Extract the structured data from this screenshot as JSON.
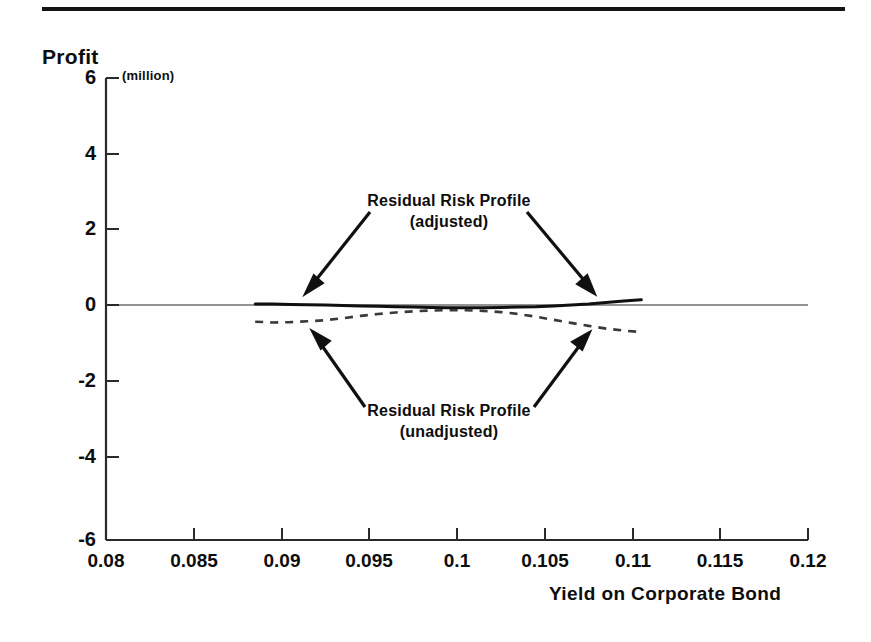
{
  "figure": {
    "has_header_rule": true,
    "background_color": "#fefefe",
    "ink_color": "#0d0d0d"
  },
  "axes": {
    "y_title": "Profit",
    "y_unit_note": "(million)",
    "x_title": "Yield on Corporate Bond"
  },
  "annotations": {
    "adjusted": {
      "line1": "Residual Risk Profile",
      "line2": "(adjusted)"
    },
    "unadjusted": {
      "line1": "Residual Risk Profile",
      "line2": "(unadjusted)"
    }
  },
  "chart_data": {
    "type": "line",
    "title": "",
    "subtitle": "",
    "xlabel": "Yield on Corporate Bond",
    "ylabel": "Profit",
    "y_unit": "(million)",
    "xlim": [
      0.08,
      0.12
    ],
    "ylim": [
      -6,
      6
    ],
    "xticks": [
      "0.08",
      "0.085",
      "0.09",
      "0.095",
      "0.1",
      "0.105",
      "0.11",
      "0.115",
      "0.12"
    ],
    "xtick_values": [
      0.08,
      0.085,
      0.09,
      0.095,
      0.1,
      0.105,
      0.11,
      0.115,
      0.12
    ],
    "yticks": [
      "6",
      "4",
      "2",
      "0",
      "-2",
      "-4",
      "-6"
    ],
    "ytick_values": [
      6,
      4,
      2,
      0,
      -2,
      -4,
      -6
    ],
    "grid": false,
    "legend": "annotations-with-arrows",
    "zero_line": true,
    "series": [
      {
        "name": "Residual Risk Profile (adjusted)",
        "style": "solid",
        "color": "#101010",
        "x": [
          0.0885,
          0.0895,
          0.0905,
          0.0915,
          0.0925,
          0.0935,
          0.0945,
          0.0955,
          0.0965,
          0.0975,
          0.0985,
          0.0995,
          0.1005,
          0.1015,
          0.1025,
          0.1035,
          0.1045,
          0.1055,
          0.1065,
          0.1075,
          0.1085,
          0.1095,
          0.1105
        ],
        "values": [
          0.13,
          0.13,
          0.12,
          0.11,
          0.1,
          0.09,
          0.08,
          0.07,
          0.06,
          0.05,
          0.04,
          0.03,
          0.03,
          0.03,
          0.04,
          0.05,
          0.06,
          0.08,
          0.1,
          0.13,
          0.17,
          0.21,
          0.24
        ]
      },
      {
        "name": "Residual Risk Profile (unadjusted)",
        "style": "dashed",
        "color": "#3a3a3a",
        "x": [
          0.0885,
          0.0895,
          0.0905,
          0.0915,
          0.0925,
          0.0935,
          0.0945,
          0.0955,
          0.0965,
          0.0975,
          0.0985,
          0.0995,
          0.1005,
          0.1015,
          0.1025,
          0.1035,
          0.1045,
          0.1055,
          0.1065,
          0.1075,
          0.1085,
          0.1095,
          0.1105
        ],
        "values": [
          -0.33,
          -0.35,
          -0.34,
          -0.32,
          -0.29,
          -0.24,
          -0.18,
          -0.13,
          -0.09,
          -0.06,
          -0.04,
          -0.03,
          -0.03,
          -0.05,
          -0.08,
          -0.13,
          -0.2,
          -0.28,
          -0.36,
          -0.44,
          -0.51,
          -0.56,
          -0.6
        ]
      }
    ]
  }
}
